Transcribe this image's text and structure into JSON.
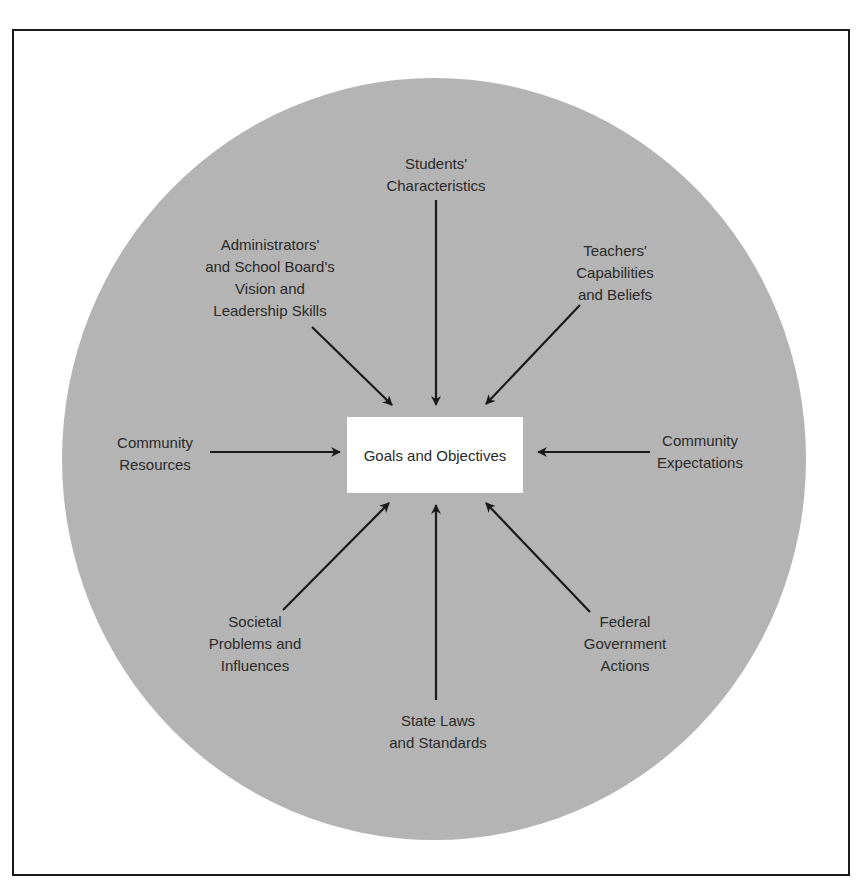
{
  "diagram": {
    "type": "radial-influence",
    "center": {
      "label": "Goals and Objectives"
    },
    "influences": [
      {
        "id": "students",
        "label": "Students'\nCharacteristics",
        "direction": "top"
      },
      {
        "id": "teachers",
        "label": "Teachers'\nCapabilities\nand Beliefs",
        "direction": "top-right"
      },
      {
        "id": "community-expectations",
        "label": "Community\nExpectations",
        "direction": "right"
      },
      {
        "id": "federal",
        "label": "Federal\nGovernment\nActions",
        "direction": "bottom-right"
      },
      {
        "id": "state",
        "label": "State Laws\nand Standards",
        "direction": "bottom"
      },
      {
        "id": "societal",
        "label": "Societal\nProblems and\nInfluences",
        "direction": "bottom-left"
      },
      {
        "id": "community-resources",
        "label": "Community\nResources",
        "direction": "left"
      },
      {
        "id": "administrators",
        "label": "Administrators'\nand School Board's\nVision and\nLeadership Skills",
        "direction": "top-left"
      }
    ],
    "colors": {
      "circle": "#b4b4b4",
      "box": "#ffffff",
      "arrow": "#1a1a1a",
      "frame": "#1a1a1a"
    }
  }
}
